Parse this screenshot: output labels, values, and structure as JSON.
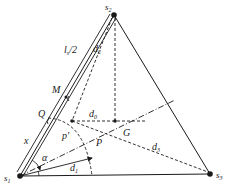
{
  "diagram": {
    "title": "",
    "vertices": {
      "s1": {
        "label": "s",
        "sub": "1"
      },
      "s2": {
        "label": "s",
        "sub": "2"
      },
      "s3": {
        "label": "s",
        "sub": "3"
      }
    },
    "points": {
      "G": "G",
      "M": "M",
      "Q": "Q",
      "P": "P",
      "p_prime": "p'"
    },
    "lengths": {
      "half_l": {
        "label": "l",
        "sub": "s",
        "suffix": "/2"
      },
      "x": "x",
      "d0": {
        "label": "d",
        "sub": "0"
      },
      "d1": {
        "label": "d",
        "sub": "1"
      },
      "d2": {
        "label": "d",
        "sub": "2"
      },
      "d3": {
        "label": "d",
        "sub": "3"
      }
    },
    "angle": "α",
    "colors": {
      "line": "#1a1a1a",
      "background": "#ffffff"
    }
  }
}
